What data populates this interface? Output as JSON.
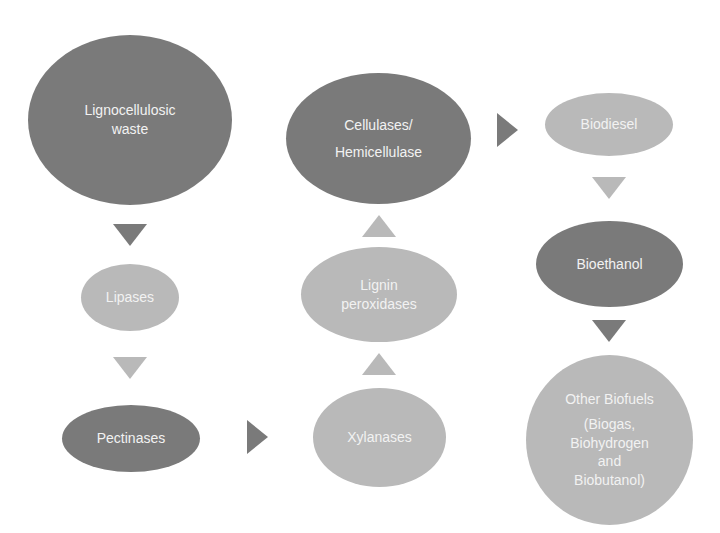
{
  "diagram": {
    "colors": {
      "dark": "#7a7a7a",
      "light": "#b9b9b9",
      "text": "#f2f2f2",
      "background": "#ffffff"
    },
    "nodes": {
      "lignocellulosic": {
        "lines": [
          "Lignocellulosic",
          "waste"
        ],
        "shade": "dark"
      },
      "lipases": {
        "lines": [
          "Lipases"
        ],
        "shade": "light"
      },
      "pectinases": {
        "lines": [
          "Pectinases"
        ],
        "shade": "dark"
      },
      "xylanases": {
        "lines": [
          "Xylanases"
        ],
        "shade": "light"
      },
      "lignin": {
        "lines": [
          "Lignin",
          "peroxidases"
        ],
        "shade": "light"
      },
      "cellulases": {
        "lines": [
          "Cellulases/",
          "Hemicellulase"
        ],
        "shade": "dark"
      },
      "biodiesel": {
        "lines": [
          "Biodiesel"
        ],
        "shade": "light"
      },
      "bioethanol": {
        "lines": [
          "Bioethanol"
        ],
        "shade": "dark"
      },
      "other": {
        "lines": [
          "Other Biofuels",
          "(Biogas,",
          "Biohydrogen",
          "and",
          "Biobutanol)"
        ],
        "shade": "light"
      }
    },
    "edges": [
      {
        "from": "Lignocellulosic waste",
        "to": "Lipases",
        "direction": "down",
        "shade": "dark"
      },
      {
        "from": "Lipases",
        "to": "Pectinases",
        "direction": "down",
        "shade": "light"
      },
      {
        "from": "Pectinases",
        "to": "Xylanases",
        "direction": "right",
        "shade": "dark"
      },
      {
        "from": "Xylanases",
        "to": "Lignin peroxidases",
        "direction": "up",
        "shade": "light"
      },
      {
        "from": "Lignin peroxidases",
        "to": "Cellulases/Hemicellulase",
        "direction": "up",
        "shade": "light"
      },
      {
        "from": "Cellulases/Hemicellulase",
        "to": "Biodiesel",
        "direction": "right",
        "shade": "dark"
      },
      {
        "from": "Biodiesel",
        "to": "Bioethanol",
        "direction": "down",
        "shade": "light"
      },
      {
        "from": "Bioethanol",
        "to": "Other Biofuels",
        "direction": "down",
        "shade": "dark"
      }
    ]
  }
}
